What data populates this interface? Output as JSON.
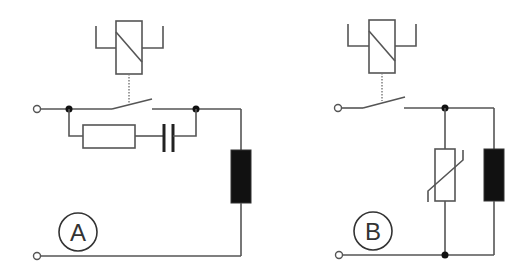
{
  "diagram": {
    "circuits": [
      {
        "id": "A",
        "label": "A",
        "components": [
          "relay-coil-actuator",
          "switch-contact",
          "resistor",
          "capacitor",
          "load-coil"
        ],
        "protection": "RC snubber across switch contact"
      },
      {
        "id": "B",
        "label": "B",
        "components": [
          "relay-coil-actuator",
          "switch-contact",
          "varistor",
          "load-coil"
        ],
        "protection": "varistor across load"
      }
    ],
    "colors": {
      "wire": "#555555",
      "coil_fill": "#111111",
      "background": "#ffffff"
    }
  }
}
